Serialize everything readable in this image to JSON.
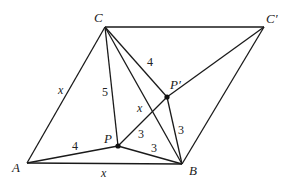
{
  "diagram": {
    "points": [
      {
        "id": "A",
        "label": "A",
        "x": 27,
        "y": 163
      },
      {
        "id": "B",
        "label": "B",
        "x": 182,
        "y": 164
      },
      {
        "id": "C",
        "label": "C",
        "x": 105,
        "y": 27
      },
      {
        "id": "Cp",
        "label": "C′",
        "x": 264,
        "y": 27
      },
      {
        "id": "P",
        "label": "P",
        "x": 118,
        "y": 146
      },
      {
        "id": "Pp",
        "label": "P′",
        "x": 167,
        "y": 97
      }
    ],
    "segments": [
      [
        "A",
        "B"
      ],
      [
        "A",
        "C"
      ],
      [
        "C",
        "Cp"
      ],
      [
        "Cp",
        "B"
      ],
      [
        "C",
        "B"
      ],
      [
        "C",
        "P"
      ],
      [
        "C",
        "Pp"
      ],
      [
        "A",
        "P"
      ],
      [
        "P",
        "B"
      ],
      [
        "P",
        "Pp"
      ],
      [
        "Pp",
        "Cp"
      ],
      [
        "Pp",
        "B"
      ]
    ],
    "length_labels": [
      {
        "text": "x",
        "italic": true,
        "x": 58,
        "y": 94
      },
      {
        "text": "5",
        "italic": false,
        "x": 102,
        "y": 96
      },
      {
        "text": "4",
        "italic": false,
        "x": 147,
        "y": 66
      },
      {
        "text": "x",
        "italic": true,
        "x": 137,
        "y": 112
      },
      {
        "text": "4",
        "italic": false,
        "x": 72,
        "y": 150
      },
      {
        "text": "3",
        "italic": false,
        "x": 138,
        "y": 138
      },
      {
        "text": "3",
        "italic": false,
        "x": 151,
        "y": 152
      },
      {
        "text": "3",
        "italic": false,
        "x": 178,
        "y": 134
      },
      {
        "text": "x",
        "italic": true,
        "x": 101,
        "y": 177
      }
    ],
    "point_label_positions": {
      "A": {
        "x": 12,
        "y": 172
      },
      "B": {
        "x": 189,
        "y": 175
      },
      "C": {
        "x": 94,
        "y": 22
      },
      "Cp": {
        "x": 266,
        "y": 23
      },
      "P": {
        "x": 104,
        "y": 143
      },
      "Pp": {
        "x": 170,
        "y": 89
      }
    },
    "dots": [
      "P",
      "Pp"
    ]
  }
}
